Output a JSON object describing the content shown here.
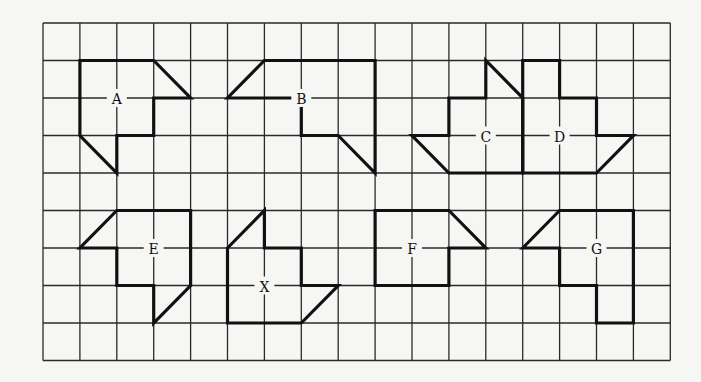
{
  "figure": {
    "type": "grid-shapes-puzzle",
    "grid": {
      "cols": 17,
      "rows": 9,
      "origin_x": 43,
      "origin_y": 23,
      "cell_w": 36.9,
      "cell_h": 37.5,
      "line_color": "#2a2a2a",
      "background": "#f6f6f4"
    },
    "shapes": [
      {
        "label": "A",
        "label_at": [
          2,
          2
        ],
        "points": [
          [
            1,
            1
          ],
          [
            3,
            1
          ],
          [
            4,
            2
          ],
          [
            3,
            2
          ],
          [
            3,
            3
          ],
          [
            2,
            3
          ],
          [
            2,
            4
          ],
          [
            1,
            3
          ]
        ]
      },
      {
        "label": "B",
        "label_at": [
          7,
          2
        ],
        "points": [
          [
            6,
            1
          ],
          [
            9,
            1
          ],
          [
            9,
            4
          ],
          [
            8,
            3
          ],
          [
            7,
            3
          ],
          [
            7,
            2
          ],
          [
            5,
            2
          ]
        ]
      },
      {
        "label": "C",
        "label_at": [
          12,
          3
        ],
        "points": [
          [
            10,
            3
          ],
          [
            11,
            3
          ],
          [
            11,
            2
          ],
          [
            12,
            2
          ],
          [
            12,
            1
          ],
          [
            13,
            2
          ],
          [
            13,
            4
          ],
          [
            11,
            4
          ]
        ]
      },
      {
        "label": "D",
        "label_at": [
          14,
          3
        ],
        "points": [
          [
            13,
            1
          ],
          [
            14,
            1
          ],
          [
            14,
            2
          ],
          [
            15,
            2
          ],
          [
            15,
            3
          ],
          [
            16,
            3
          ],
          [
            15,
            4
          ],
          [
            13,
            4
          ]
        ]
      },
      {
        "label": "E",
        "label_at": [
          3,
          6
        ],
        "points": [
          [
            2,
            5
          ],
          [
            4,
            5
          ],
          [
            4,
            7
          ],
          [
            3,
            8
          ],
          [
            3,
            7
          ],
          [
            2,
            7
          ],
          [
            2,
            6
          ],
          [
            1,
            6
          ]
        ]
      },
      {
        "label": "X",
        "label_at": [
          6,
          7
        ],
        "points": [
          [
            5,
            6
          ],
          [
            6,
            5
          ],
          [
            6,
            6
          ],
          [
            7,
            6
          ],
          [
            7,
            7
          ],
          [
            8,
            7
          ],
          [
            7,
            8
          ],
          [
            5,
            8
          ]
        ]
      },
      {
        "label": "F",
        "label_at": [
          10,
          6
        ],
        "points": [
          [
            9,
            5
          ],
          [
            11,
            5
          ],
          [
            12,
            6
          ],
          [
            11,
            6
          ],
          [
            11,
            7
          ],
          [
            9,
            7
          ]
        ]
      },
      {
        "label": "G",
        "label_at": [
          15,
          6
        ],
        "points": [
          [
            13,
            6
          ],
          [
            14,
            5
          ],
          [
            16,
            5
          ],
          [
            16,
            8
          ],
          [
            15,
            8
          ],
          [
            15,
            7
          ],
          [
            14,
            7
          ],
          [
            14,
            6
          ]
        ]
      }
    ]
  }
}
